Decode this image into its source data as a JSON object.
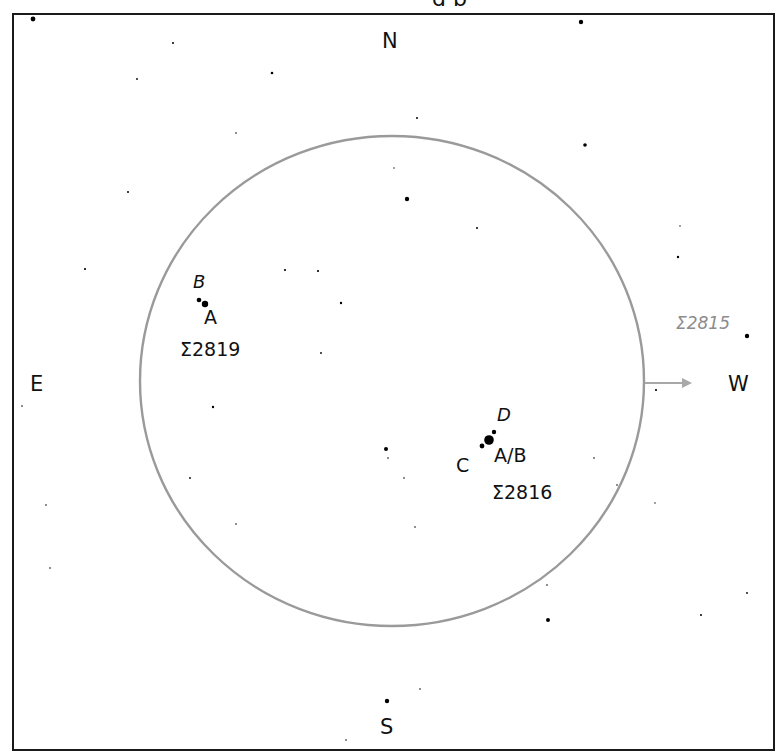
{
  "title_fragment": "g p",
  "cardinals": {
    "north": "N",
    "south": "S",
    "east": "E",
    "west": "W"
  },
  "colors": {
    "frame": "#1a1a1a",
    "field_circle": "#9a9a9a",
    "arrow": "#a8a8a8",
    "star": "#000000",
    "label": "#111111",
    "outside_label": "#8c8c8c"
  },
  "field_of_view": {
    "cx": 392,
    "cy": 381,
    "rx": 252,
    "ry": 245
  },
  "drift_arrow": {
    "direction": "W",
    "x1": 645,
    "y1": 383,
    "x2": 690,
    "y2": 383
  },
  "double_stars": [
    {
      "designation": "Σ2819",
      "components": [
        {
          "label": "A",
          "x": 205,
          "y": 304,
          "r": 3.2
        },
        {
          "label": "B",
          "x": 199,
          "y": 300,
          "r": 2.3
        }
      ]
    },
    {
      "designation": "Σ2816",
      "components": [
        {
          "label": "A/B",
          "x": 489,
          "y": 440,
          "r": 4.8
        },
        {
          "label": "C",
          "x": 482,
          "y": 446,
          "r": 2.4
        },
        {
          "label": "D",
          "x": 494,
          "y": 432,
          "r": 2.2
        }
      ]
    },
    {
      "designation": "Σ2815",
      "outside_field": true,
      "components": [
        {
          "label": "",
          "x": 747,
          "y": 336,
          "r": 2.2
        }
      ]
    }
  ],
  "labels": {
    "s2819_B": "B",
    "s2819_A": "A",
    "s2819_name": "Σ2819",
    "s2816_D": "D",
    "s2816_AB": "A/B",
    "s2816_C": "C",
    "s2816_name": "Σ2816",
    "s2815_name": "Σ2815"
  },
  "field_stars": [
    [
      33,
      19,
      2.4
    ],
    [
      581,
      22,
      2.2
    ],
    [
      173,
      43,
      1.0
    ],
    [
      137,
      79,
      0.9
    ],
    [
      272,
      73,
      1.3
    ],
    [
      417,
      118,
      1.0
    ],
    [
      585,
      145,
      1.8
    ],
    [
      236,
      133,
      0.8
    ],
    [
      128,
      192,
      1.0
    ],
    [
      394,
      168,
      0.7
    ],
    [
      407,
      199,
      2.2
    ],
    [
      477,
      228,
      1.0
    ],
    [
      680,
      226,
      0.7
    ],
    [
      678,
      257,
      1.2
    ],
    [
      85,
      269,
      1.1
    ],
    [
      285,
      270,
      1.1
    ],
    [
      318,
      271,
      1.1
    ],
    [
      341,
      303,
      1.2
    ],
    [
      321,
      353,
      0.9
    ],
    [
      213,
      407,
      1.2
    ],
    [
      22,
      406,
      0.8
    ],
    [
      656,
      390,
      1.1
    ],
    [
      386,
      449,
      2.0
    ],
    [
      388,
      458,
      0.8
    ],
    [
      404,
      478,
      0.8
    ],
    [
      190,
      478,
      0.9
    ],
    [
      594,
      458,
      0.8
    ],
    [
      617,
      485,
      0.8
    ],
    [
      655,
      503,
      0.7
    ],
    [
      46,
      505,
      0.8
    ],
    [
      236,
      524,
      0.8
    ],
    [
      415,
      527,
      0.8
    ],
    [
      50,
      568,
      0.8
    ],
    [
      547,
      585,
      0.8
    ],
    [
      548,
      620,
      2.0
    ],
    [
      747,
      593,
      0.9
    ],
    [
      701,
      615,
      1.0
    ],
    [
      420,
      689,
      0.8
    ],
    [
      387,
      701,
      2.2
    ],
    [
      346,
      740,
      0.8
    ]
  ]
}
